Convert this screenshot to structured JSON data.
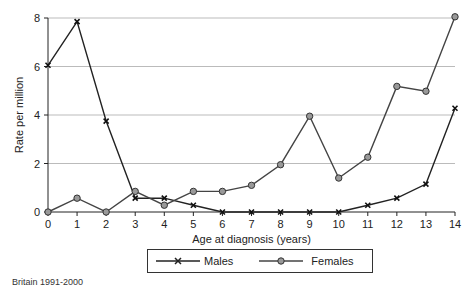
{
  "chart_data": {
    "type": "line",
    "title": "",
    "xlabel": "Age at diagnosis (years)",
    "ylabel": "Rate per million",
    "x": [
      0,
      1,
      2,
      3,
      4,
      5,
      6,
      7,
      8,
      9,
      10,
      11,
      12,
      13,
      14
    ],
    "xlim": [
      0,
      14
    ],
    "ylim": [
      0,
      8
    ],
    "yticks": [
      0,
      2,
      4,
      6,
      8
    ],
    "grid": "horizontal",
    "legend_position": "bottom",
    "series": [
      {
        "name": "Males",
        "marker": "x",
        "color": "#222222",
        "values": [
          6.05,
          7.85,
          3.75,
          0.57,
          0.57,
          0.28,
          0,
          0,
          0,
          0,
          0,
          0.28,
          0.57,
          1.15,
          4.28
        ]
      },
      {
        "name": "Females",
        "marker": "circle",
        "color": "#444444",
        "values": [
          0,
          0.57,
          0,
          0.85,
          0.28,
          0.85,
          0.85,
          1.1,
          1.95,
          3.95,
          1.4,
          2.26,
          5.18,
          4.98,
          8.05
        ]
      }
    ]
  },
  "legend": {
    "males": "Males",
    "females": "Females"
  },
  "source_note": "Britain 1991-2000",
  "colors": {
    "line": "#222222",
    "grid": "#bbbbbb",
    "marker_fill": "#999999"
  }
}
